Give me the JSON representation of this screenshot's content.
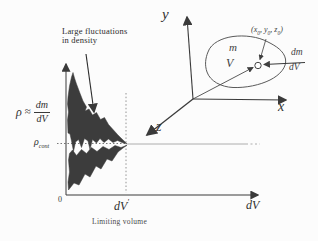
{
  "colors": {
    "ink": "#3a3a3a",
    "curve_fill": "#3c3c3c",
    "soft_gray": "#9a9a9a"
  },
  "graph": {
    "annotation": {
      "line1": "Large fluctuations",
      "line2": "in density"
    },
    "ylabel": {
      "rho": "ρ",
      "approx": "≈",
      "numerator": "dm",
      "denominator": "dV"
    },
    "rho_cont": {
      "base": "ρ",
      "sub": "cont"
    },
    "origin": "0",
    "tick": {
      "base": "dV",
      "prime": "'"
    },
    "axis_label": "dV",
    "caption": "Limiting volume"
  },
  "coords": {
    "y": "y",
    "x": "x",
    "z": "z",
    "mass": "m",
    "volume": "V",
    "point": {
      "p1": "(x",
      "s1": "0",
      "p2": ", y",
      "s2": "0",
      "p3": ", z",
      "s3": "0",
      "p4": ")"
    },
    "dm": "dm",
    "dv": "dV"
  }
}
